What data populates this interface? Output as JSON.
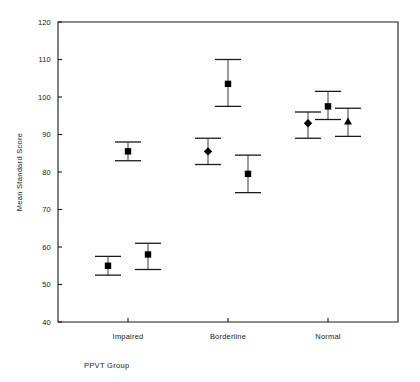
{
  "chart_data": {
    "type": "scatter",
    "title": "",
    "subtitle": "",
    "xlabel": "PPVT Group",
    "ylabel": "Mean Standard Score",
    "categories": [
      "Impaired",
      "Borderline",
      "Normal"
    ],
    "ylim": [
      40,
      120
    ],
    "yticks": [
      40,
      50,
      60,
      70,
      80,
      90,
      100,
      110,
      120
    ],
    "ytick_labels": [
      "40",
      "50",
      "60",
      "70",
      "80",
      "90",
      "100",
      "110",
      "120"
    ],
    "grid": false,
    "legend": "none",
    "error_bar_style": "mean with capped error bars",
    "points": [
      {
        "group": "Impaired",
        "x": 0.8,
        "mean": 55.0,
        "lower": 52.5,
        "upper": 57.5,
        "marker": "square"
      },
      {
        "group": "Impaired",
        "x": 1.2,
        "mean": 58.0,
        "lower": 54.0,
        "upper": 61.0,
        "marker": "square"
      },
      {
        "group": "Impaired",
        "x": 1.0,
        "mean": 85.5,
        "lower": 83.0,
        "upper": 88.0,
        "marker": "square"
      },
      {
        "group": "Borderline",
        "x": 1.8,
        "mean": 85.5,
        "lower": 82.0,
        "upper": 89.0,
        "marker": "diamond"
      },
      {
        "group": "Borderline",
        "x": 2.0,
        "mean": 103.5,
        "lower": 97.5,
        "upper": 110.0,
        "marker": "square"
      },
      {
        "group": "Borderline",
        "x": 2.2,
        "mean": 79.5,
        "lower": 74.5,
        "upper": 84.5,
        "marker": "square"
      },
      {
        "group": "Normal",
        "x": 2.8,
        "mean": 93.0,
        "lower": 89.0,
        "upper": 96.0,
        "marker": "diamond"
      },
      {
        "group": "Normal",
        "x": 3.0,
        "mean": 97.5,
        "lower": 94.0,
        "upper": 101.5,
        "marker": "square"
      },
      {
        "group": "Normal",
        "x": 3.2,
        "mean": 93.5,
        "lower": 89.5,
        "upper": 97.0,
        "marker": "triangle"
      }
    ],
    "colors": {
      "marker": "#000000",
      "error_bar": "#4d4d4d",
      "axis": "#1a1a1a",
      "background": "#ffffff"
    }
  }
}
